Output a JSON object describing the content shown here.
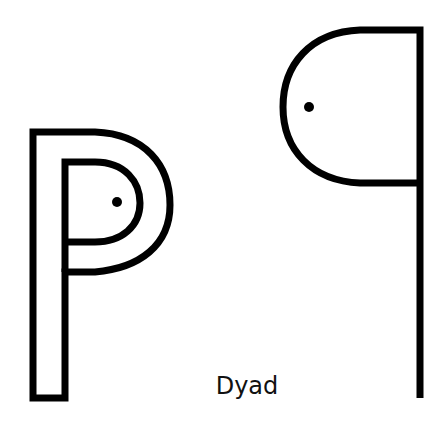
{
  "caption": "Dyad",
  "glyphs": [
    {
      "name": "left-glyph",
      "description": "Outlined double-line P shape with dot inside inner bowl"
    },
    {
      "name": "right-glyph",
      "description": "Mirrored single-stroke q shape with dot inside bowl"
    }
  ],
  "colors": {
    "stroke": "#000000",
    "background": "#ffffff"
  }
}
